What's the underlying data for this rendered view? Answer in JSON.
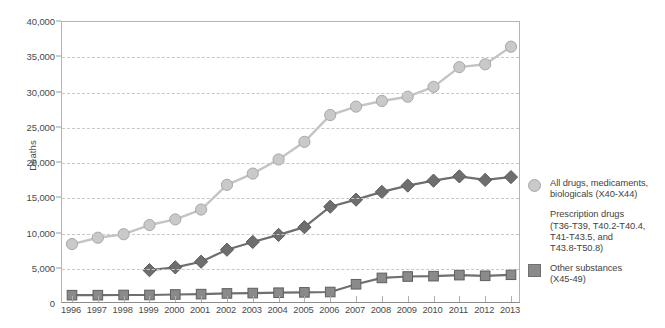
{
  "chart_data": {
    "type": "line",
    "title": "",
    "xlabel": "",
    "ylabel": "Deaths",
    "ylim": [
      0,
      40000
    ],
    "yticks": [
      0,
      5000,
      10000,
      15000,
      20000,
      25000,
      30000,
      35000,
      40000
    ],
    "ytick_labels": [
      "0",
      "5,000",
      "10,000",
      "15,000",
      "20,000",
      "25,000",
      "30,000",
      "35,000",
      "40,000"
    ],
    "grid": true,
    "legend_position": "right",
    "categories": [
      1996,
      1997,
      1998,
      1999,
      2000,
      2001,
      2002,
      2003,
      2004,
      2005,
      2006,
      2007,
      2008,
      2009,
      2010,
      2011,
      2012,
      2013
    ],
    "xtick_labels": [
      "1996",
      "1997",
      "1998",
      "1999",
      "2000",
      "2001",
      "2002",
      "2003",
      "2004",
      "2005",
      "2006",
      "2007",
      "2008",
      "2009",
      "2010",
      "2011",
      "2012",
      "2013"
    ],
    "series": [
      {
        "name": "All drugs, medicaments, biologicals (X40-X44)",
        "marker": "circle",
        "color": "#c9c9c9",
        "line_color": "#c4c4c4",
        "values": [
          8500,
          9400,
          9900,
          11200,
          12000,
          13400,
          16900,
          18500,
          20500,
          23000,
          26800,
          28000,
          28800,
          29400,
          30800,
          33600,
          34000,
          36500
        ]
      },
      {
        "name": "Prescription drugs (T36-T39, T40.2-T40.4, T41-T43.5, and T43.8-T50.8)",
        "marker": "diamond",
        "color": "#6e6e6e",
        "line_color": "#6e6e6e",
        "values": [
          null,
          null,
          null,
          4800,
          5200,
          6000,
          7700,
          8800,
          9800,
          10900,
          13800,
          14800,
          15900,
          16800,
          17500,
          18100,
          17600,
          18000
        ]
      },
      {
        "name": "Other substances (X45-49)",
        "marker": "square",
        "color": "#8a8a8a",
        "line_color": "#6f6f6f",
        "values": [
          1250,
          1250,
          1280,
          1280,
          1350,
          1400,
          1500,
          1550,
          1600,
          1650,
          1700,
          2800,
          3700,
          3900,
          3950,
          4100,
          4000,
          4150
        ]
      }
    ]
  },
  "axis": {
    "y_title": "Deaths"
  },
  "legend": {
    "items": [
      {
        "marker": "circle",
        "label": "All drugs, medicaments,\nbiologicals (X40-X44)"
      },
      {
        "marker": "diamond",
        "label": "Prescription drugs\n(T36-T39, T40.2-T40.4,\nT41-T43.5, and\nT43.8-T50.8)"
      },
      {
        "marker": "square",
        "label": "Other substances\n(X45-49)"
      }
    ]
  },
  "colors": {
    "all_drugs": "#c9c9c9",
    "prescription": "#6e6e6e",
    "other": "#8a8a8a",
    "grid": "#c8c8c8",
    "axis": "#b4b4b4",
    "text": "#4a4a4a"
  }
}
